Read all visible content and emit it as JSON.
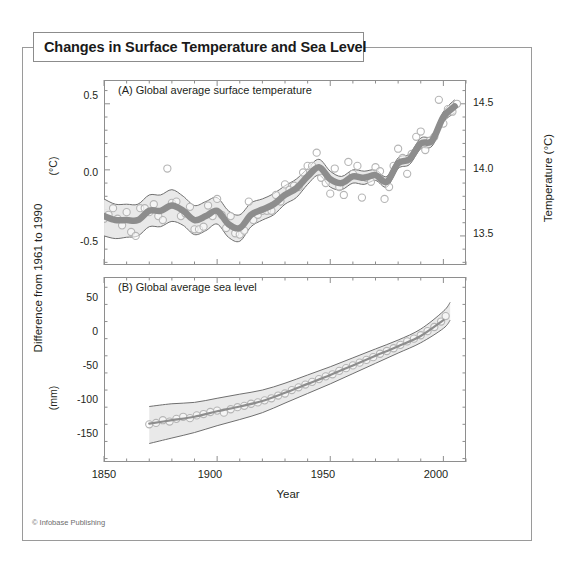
{
  "figure": {
    "title": "Changes in Surface Temperature and Sea Level",
    "credit": "© Infobase Publishing"
  },
  "axes": {
    "x_title": "Year",
    "y_title": "Difference from 1961 to 1990",
    "y_sub_top": "(°C)",
    "y_sub_bottom": "(mm)",
    "right_title": "Temperature (°C)",
    "x_ticks": [
      "1850",
      "1900",
      "1950",
      "2000"
    ],
    "a_left_ticks": [
      "0.5",
      "0.0",
      "-0.5"
    ],
    "a_right_ticks": [
      "14.5",
      "14.0",
      "13.5"
    ],
    "b_left_ticks": [
      "50",
      "0",
      "-50",
      "-100",
      "-150"
    ]
  },
  "panels": {
    "a_label": "(A) Global average surface temperature",
    "b_label": "(B) Global average sea level"
  },
  "colors": {
    "band_fill": "#e8e8e8",
    "band_line": "#6f6f6f",
    "trend_line": "#8d8d8d",
    "marker_stroke": "#b5b5b5",
    "frame": "#8e8e8e",
    "title_border": "#8c8c8c",
    "text": "#231f20"
  },
  "chart_data": [
    {
      "type": "line",
      "id": "panel-a-temperature",
      "title": "(A) Global average surface temperature",
      "xlabel": "Year",
      "ylabel": "Difference from 1961 to 1990 (°C)",
      "y2label": "Temperature (°C)",
      "xlim": [
        1850,
        2010
      ],
      "ylim": [
        -0.72,
        0.68
      ],
      "y2lim": [
        13.28,
        14.68
      ],
      "y_ticks": [
        0.5,
        0.0,
        -0.5
      ],
      "y2_ticks": [
        14.5,
        14.0,
        13.5
      ],
      "x_ticks": [
        1850,
        1900,
        1950,
        2000
      ],
      "grid": false,
      "legend": "none",
      "series": [
        {
          "name": "Annual anomaly (markers)",
          "style": "open-circles",
          "x": [
            1850,
            1852,
            1854,
            1856,
            1858,
            1860,
            1862,
            1864,
            1866,
            1868,
            1870,
            1872,
            1874,
            1876,
            1878,
            1880,
            1882,
            1884,
            1886,
            1888,
            1890,
            1892,
            1894,
            1896,
            1898,
            1900,
            1902,
            1904,
            1906,
            1908,
            1910,
            1912,
            1914,
            1916,
            1918,
            1920,
            1922,
            1924,
            1926,
            1928,
            1930,
            1932,
            1934,
            1936,
            1938,
            1940,
            1942,
            1944,
            1946,
            1948,
            1950,
            1952,
            1954,
            1956,
            1958,
            1960,
            1962,
            1964,
            1966,
            1968,
            1970,
            1972,
            1974,
            1976,
            1978,
            1980,
            1982,
            1984,
            1986,
            1988,
            1990,
            1992,
            1994,
            1996,
            1998,
            2000,
            2002,
            2004,
            2006
          ],
          "values": [
            -0.37,
            -0.34,
            -0.29,
            -0.37,
            -0.42,
            -0.32,
            -0.47,
            -0.5,
            -0.29,
            -0.29,
            -0.32,
            -0.26,
            -0.35,
            -0.38,
            0.01,
            -0.25,
            -0.24,
            -0.35,
            -0.33,
            -0.28,
            -0.45,
            -0.45,
            -0.43,
            -0.27,
            -0.35,
            -0.22,
            -0.34,
            -0.44,
            -0.35,
            -0.48,
            -0.49,
            -0.46,
            -0.24,
            -0.38,
            -0.34,
            -0.31,
            -0.31,
            -0.31,
            -0.19,
            -0.24,
            -0.11,
            -0.15,
            -0.12,
            -0.13,
            -0.02,
            0.03,
            0.03,
            0.13,
            -0.06,
            -0.1,
            -0.18,
            0.01,
            -0.13,
            -0.19,
            0.06,
            -0.03,
            0.03,
            -0.21,
            -0.06,
            -0.09,
            0.02,
            -0.01,
            -0.22,
            -0.13,
            0.03,
            0.16,
            0.09,
            -0.03,
            0.12,
            0.25,
            0.29,
            0.15,
            0.22,
            0.25,
            0.53,
            0.35,
            0.46,
            0.44,
            0.5
          ]
        },
        {
          "name": "Smoothed trend",
          "style": "thick-gray-line",
          "x": [
            1850,
            1855,
            1860,
            1865,
            1870,
            1875,
            1880,
            1885,
            1890,
            1895,
            1900,
            1905,
            1910,
            1915,
            1920,
            1925,
            1930,
            1935,
            1940,
            1945,
            1950,
            1955,
            1960,
            1965,
            1970,
            1975,
            1980,
            1985,
            1990,
            1995,
            2000,
            2005
          ],
          "values": [
            -0.35,
            -0.38,
            -0.38,
            -0.38,
            -0.31,
            -0.31,
            -0.27,
            -0.31,
            -0.38,
            -0.35,
            -0.31,
            -0.41,
            -0.44,
            -0.34,
            -0.3,
            -0.26,
            -0.19,
            -0.14,
            -0.05,
            0.02,
            -0.07,
            -0.1,
            -0.05,
            -0.06,
            -0.04,
            -0.09,
            0.05,
            0.08,
            0.2,
            0.22,
            0.4,
            0.48
          ]
        },
        {
          "name": "Uncertainty band (upper)",
          "style": "band-edge",
          "x": [
            1850,
            1855,
            1860,
            1865,
            1870,
            1875,
            1880,
            1885,
            1890,
            1895,
            1900,
            1905,
            1910,
            1915,
            1920,
            1925,
            1930,
            1935,
            1940,
            1945,
            1950,
            1955,
            1960,
            1965,
            1970,
            1975,
            1980,
            1985,
            1990,
            1995,
            2000,
            2005
          ],
          "values": [
            -0.22,
            -0.26,
            -0.26,
            -0.26,
            -0.19,
            -0.19,
            -0.15,
            -0.2,
            -0.27,
            -0.24,
            -0.21,
            -0.31,
            -0.34,
            -0.25,
            -0.22,
            -0.18,
            -0.12,
            -0.07,
            0.01,
            0.08,
            -0.01,
            -0.05,
            0.0,
            -0.01,
            0.0,
            -0.05,
            0.09,
            0.12,
            0.24,
            0.26,
            0.44,
            0.53
          ]
        },
        {
          "name": "Uncertainty band (lower)",
          "style": "band-edge",
          "x": [
            1850,
            1855,
            1860,
            1865,
            1870,
            1875,
            1880,
            1885,
            1890,
            1895,
            1900,
            1905,
            1910,
            1915,
            1920,
            1925,
            1930,
            1935,
            1940,
            1945,
            1950,
            1955,
            1960,
            1965,
            1970,
            1975,
            1980,
            1985,
            1990,
            1995,
            2000,
            2005
          ],
          "values": [
            -0.5,
            -0.52,
            -0.51,
            -0.5,
            -0.43,
            -0.43,
            -0.39,
            -0.42,
            -0.49,
            -0.46,
            -0.41,
            -0.51,
            -0.54,
            -0.43,
            -0.38,
            -0.34,
            -0.26,
            -0.21,
            -0.11,
            -0.04,
            -0.13,
            -0.15,
            -0.1,
            -0.11,
            -0.08,
            -0.13,
            0.01,
            0.04,
            0.16,
            0.18,
            0.36,
            0.43
          ]
        }
      ]
    },
    {
      "type": "line",
      "id": "panel-b-sea-level",
      "title": "(B) Global average sea level",
      "xlabel": "Year",
      "ylabel": "Difference from 1961 to 1990 (mm)",
      "xlim": [
        1850,
        2010
      ],
      "ylim": [
        -185,
        85
      ],
      "y_ticks": [
        50,
        0,
        -50,
        -100,
        -150
      ],
      "x_ticks": [
        1850,
        1900,
        1950,
        2000
      ],
      "grid": false,
      "legend": "none",
      "series": [
        {
          "name": "Annual sea level (markers)",
          "style": "open-circles",
          "x": [
            1870,
            1873,
            1876,
            1879,
            1882,
            1885,
            1888,
            1891,
            1894,
            1897,
            1900,
            1903,
            1906,
            1909,
            1912,
            1915,
            1918,
            1921,
            1924,
            1927,
            1930,
            1933,
            1936,
            1939,
            1942,
            1945,
            1948,
            1951,
            1954,
            1957,
            1960,
            1963,
            1966,
            1969,
            1972,
            1975,
            1978,
            1981,
            1984,
            1987,
            1990,
            1993,
            1996,
            1999,
            2001
          ],
          "values": [
            -130,
            -128,
            -124,
            -126,
            -122,
            -119,
            -121,
            -117,
            -115,
            -112,
            -110,
            -113,
            -108,
            -105,
            -103,
            -100,
            -98,
            -95,
            -92,
            -88,
            -85,
            -80,
            -76,
            -72,
            -68,
            -64,
            -60,
            -57,
            -52,
            -48,
            -44,
            -40,
            -36,
            -32,
            -27,
            -23,
            -19,
            -14,
            -9,
            -5,
            0,
            6,
            12,
            20,
            28
          ]
        },
        {
          "name": "Smoothed trend",
          "style": "thin-gray-line",
          "x": [
            1870,
            1880,
            1890,
            1900,
            1910,
            1920,
            1930,
            1940,
            1950,
            1960,
            1970,
            1980,
            1990,
            2000
          ],
          "values": [
            -129,
            -124,
            -119,
            -111,
            -104,
            -96,
            -84,
            -71,
            -58,
            -44,
            -30,
            -16,
            -1,
            22
          ]
        },
        {
          "name": "Uncertainty band (upper)",
          "style": "band-edge",
          "x": [
            1870,
            1880,
            1890,
            1900,
            1910,
            1920,
            1930,
            1940,
            1950,
            1960,
            1970,
            1980,
            1990,
            2000,
            2003
          ],
          "values": [
            -104,
            -100,
            -98,
            -92,
            -86,
            -80,
            -70,
            -58,
            -46,
            -33,
            -20,
            -7,
            9,
            35,
            48
          ]
        },
        {
          "name": "Uncertainty band (lower)",
          "style": "band-edge",
          "x": [
            1870,
            1880,
            1890,
            1900,
            1910,
            1920,
            1930,
            1940,
            1950,
            1960,
            1970,
            1980,
            1990,
            2000,
            2003
          ],
          "values": [
            -158,
            -150,
            -142,
            -132,
            -123,
            -113,
            -99,
            -85,
            -71,
            -56,
            -41,
            -26,
            -11,
            10,
            22
          ]
        }
      ]
    }
  ]
}
